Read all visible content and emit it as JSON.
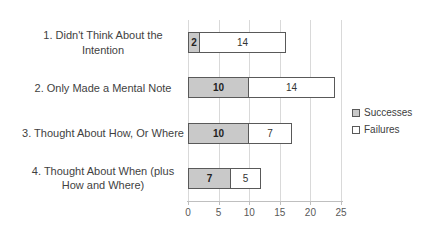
{
  "chart_data": {
    "type": "bar",
    "orientation": "horizontal",
    "stacked": true,
    "categories": [
      "1. Didn't Think About the Intention",
      "2. Only Made a Mental Note",
      "3. Thought About How, Or Where",
      "4. Thought About When (plus How and Where)"
    ],
    "series": [
      {
        "name": "Successes",
        "values": [
          2,
          10,
          10,
          7
        ]
      },
      {
        "name": "Failures",
        "values": [
          14,
          14,
          7,
          5
        ]
      }
    ],
    "x_ticks": [
      0,
      5,
      10,
      15,
      20,
      25
    ],
    "xlim": [
      0,
      25
    ],
    "grid": "vertical major gridlines",
    "data_labels": true,
    "legend_position": "right"
  },
  "colors": {
    "successes_fill": "#c9c9c9",
    "failures_fill": "#ffffff",
    "bar_border": "#595959",
    "gridline": "#d9d9d9",
    "axis_line": "#bfbfbf",
    "category_text": "#3f3f3f",
    "tick_text": "#595959",
    "background": "#ffffff"
  }
}
